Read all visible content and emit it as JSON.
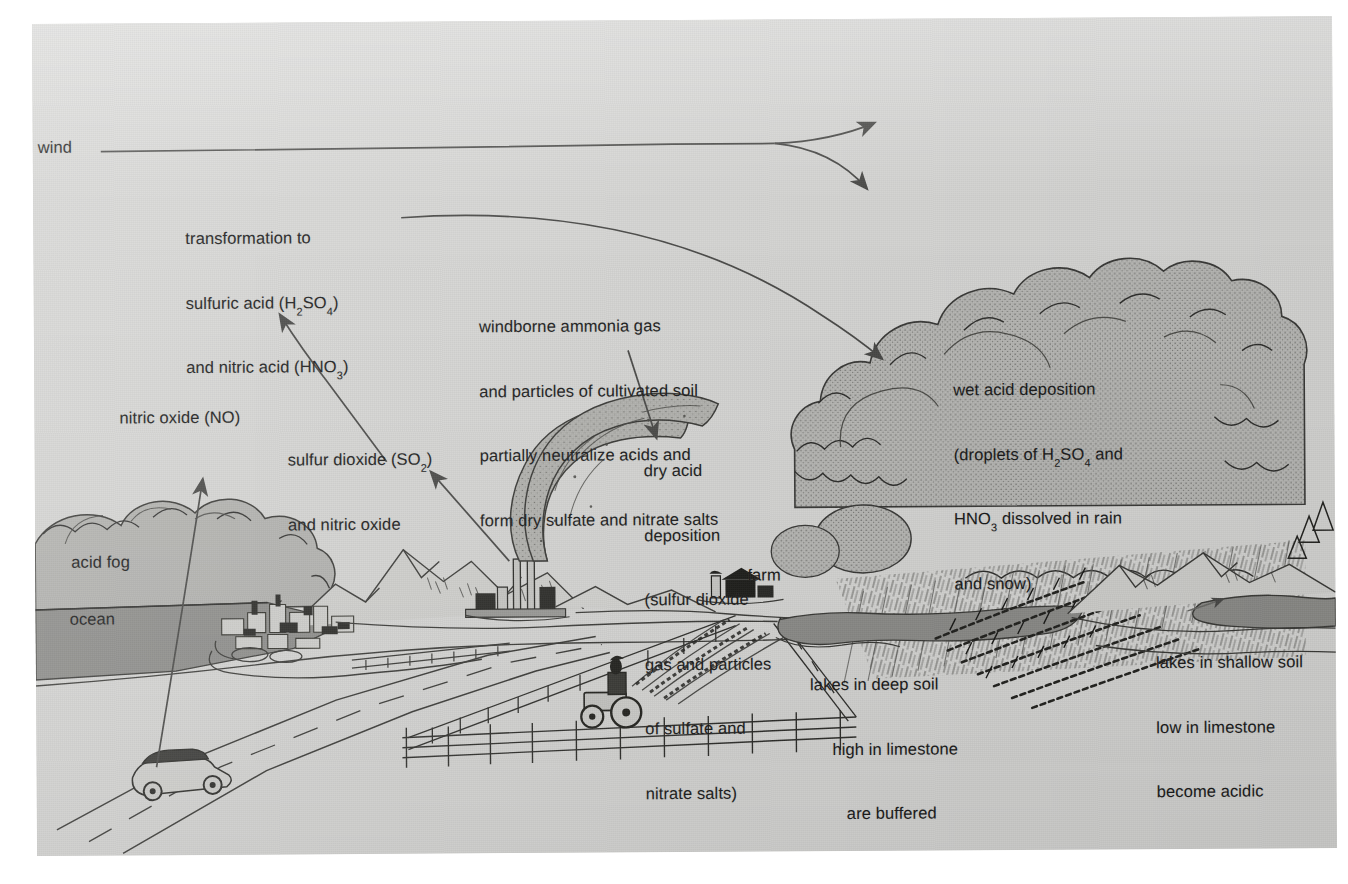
{
  "figure": {
    "kind": "acid-deposition-diagram",
    "medium": "scanned textbook illustration",
    "background_color": "#d7d7d5",
    "ink_color": "#1b1b1b"
  },
  "labels": {
    "wind": "wind",
    "transformation": {
      "line1": "transformation to",
      "line2_a": "sulfuric acid (H",
      "line2_sub": "2",
      "line2_b": "SO",
      "line2_sub2": "4",
      "line2_c": ")",
      "line3_a": "and nitric acid (HNO",
      "line3_sub": "3",
      "line3_b": ")"
    },
    "nitric_oxide": "nitric oxide (NO)",
    "sulfur_dioxide": {
      "line1_a": "sulfur dioxide (SO",
      "line1_sub": "2",
      "line1_b": ")",
      "line2": "and nitric oxide"
    },
    "windborne_ammonia": {
      "line1": "windborne ammonia gas",
      "line2": "and particles of cultivated soil",
      "line3": "partially neutralize acids and",
      "line4": "form dry sulfate and nitrate salts"
    },
    "dry_acid_deposition": {
      "line1": "dry acid",
      "line2": "deposition",
      "line3": "(sulfur dioxide",
      "line4": "gas and particles",
      "line5": "of sulfate and",
      "line6": "nitrate salts)"
    },
    "wet_acid_deposition": {
      "line1": "wet acid deposition",
      "line2_a": "(droplets of H",
      "line2_sub": "2",
      "line2_b": "SO",
      "line2_sub2": "4",
      "line2_c": " and",
      "line3_a": "HNO",
      "line3_sub": "3",
      "line3_b": " dissolved in rain",
      "line4": "and snow)"
    },
    "acid_fog": "acid fog",
    "ocean": "ocean",
    "farm": "farm",
    "lakes_deep": {
      "line1": "lakes in deep soil",
      "line2": "high in limestone",
      "line3": "are buffered"
    },
    "lakes_shallow": {
      "line1": "lakes in shallow soil",
      "line2": "low in limestone",
      "line3": "become acidic"
    }
  },
  "scene_elements": {
    "ocean": "ocean-water",
    "fog_bank": "acid-fog-cloud",
    "coastal_town": "coastal-town",
    "highway": "highway-road",
    "car": "car",
    "mountains_left": "mountain-range-left",
    "factory": "factory-with-smokestacks",
    "smoke_plumes": "smoke-plume",
    "farmland": "farm-field",
    "tractor": "tractor",
    "fences": "fence-line",
    "farm_buildings": "farm-building",
    "buffered_lake": "buffered-lake",
    "storm_cloud": "storm-cloud",
    "rain": "rain-streaks",
    "dead_forest": "dead-forest",
    "acidic_lake": "acidic-lake",
    "mountains_right": "mountain-range-right"
  },
  "arrows": {
    "wind_main": "wind-arrow-split",
    "wind_upper_branch": "wind-arrow-upper",
    "wind_lower_branch": "wind-arrow-lower",
    "transport_to_cloud": "transport-arrow-to-cloud",
    "no_up": "nitric-oxide-arrow",
    "so2_up": "sulfur-dioxide-arrow",
    "transformation_up": "transformation-arrow",
    "dry_deposition_down": "dry-deposition-arrow",
    "lakes_shallow_pointer": "lakes-shallow-pointer"
  }
}
